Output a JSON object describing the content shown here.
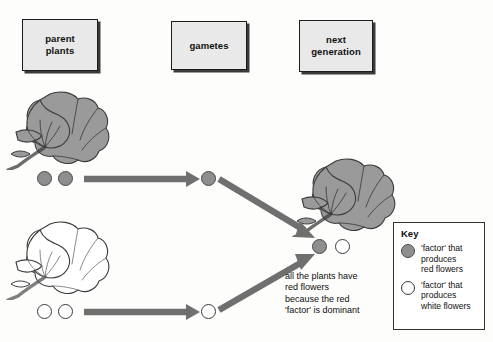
{
  "diagram": {
    "stage_labels": [
      {
        "id": "parent-plants",
        "text": "parent\nplants"
      },
      {
        "id": "gametes",
        "text": "gametes"
      },
      {
        "id": "next-generation",
        "text": "next\ngeneration"
      }
    ],
    "annotation": "all the plants have\nred flowers\nbecause the red\n'factor' is dominant",
    "parents": [
      {
        "id": "red-parent",
        "flower_type": "red",
        "factors": [
          "red",
          "red"
        ],
        "gamete_factors": [
          "red"
        ]
      },
      {
        "id": "white-parent",
        "flower_type": "white",
        "factors": [
          "white",
          "white"
        ],
        "gamete_factors": [
          "white"
        ]
      }
    ],
    "offspring": {
      "id": "f1-offspring",
      "flower_type": "red",
      "factors": [
        "red",
        "white"
      ]
    },
    "key": {
      "title": "Key",
      "entries": [
        {
          "swatch": "red",
          "text": "'factor' that\nproduces\nred flowers"
        },
        {
          "swatch": "white",
          "text": "'factor' that\nproduces\nwhite flowers"
        }
      ]
    },
    "colors": {
      "red_factor_fill": "#8e8e8e",
      "red_factor_stroke": "#4a4a4a",
      "white_factor_fill": "#ffffff",
      "white_factor_stroke": "#3c3c3c",
      "arrow": "#6f6f6f",
      "label_box_fill": "#e9e9e9",
      "label_box_border": "#1c1c1c",
      "flower_red_fill": "#9a9a9a",
      "flower_outline": "#3c3c3c",
      "background": "#fdfdfc"
    }
  }
}
